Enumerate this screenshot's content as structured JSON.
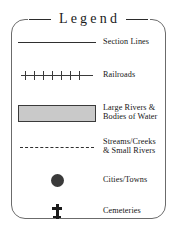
{
  "legend": {
    "title": "Legend",
    "entries": [
      {
        "symbol": "solid-line",
        "label": "Section Lines"
      },
      {
        "symbol": "railroad-line",
        "label": "Railroads"
      },
      {
        "symbol": "filled-rectangle",
        "label": "Large Rivers &\nBodies of Water",
        "fill_color": "#c9c9c9",
        "border_color": "#3a3a3a"
      },
      {
        "symbol": "dashed-line",
        "label": "Streams/Creeks\n& Small Rivers"
      },
      {
        "symbol": "filled-circle",
        "label": "Cities/Towns",
        "fill_color": "#3a3a3a"
      },
      {
        "symbol": "cross",
        "label": "Cemeteries",
        "fill_color": "#1a1a1a"
      }
    ],
    "frame": {
      "border_color": "#6b6b6b",
      "background": "#ffffff"
    },
    "line_color": "#2f2f2f",
    "text_color": "#151515"
  }
}
